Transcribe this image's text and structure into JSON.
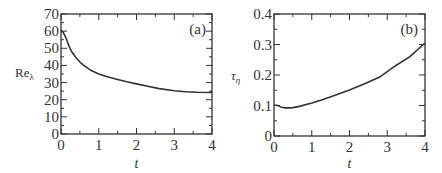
{
  "chart_data": [
    {
      "type": "line",
      "panel_label": "(a)",
      "title": "",
      "xlabel": "t",
      "ylabel": "Re_λ",
      "ylabel_main": "Re",
      "ylabel_sub": "λ",
      "xlim": [
        0,
        4
      ],
      "ylim": [
        0,
        70
      ],
      "xticks": [
        0,
        1,
        2,
        3,
        4
      ],
      "xtick_labels": [
        "0",
        "1",
        "2",
        "3",
        "4"
      ],
      "yticks": [
        0,
        10,
        20,
        30,
        40,
        50,
        60,
        70
      ],
      "ytick_labels": [
        "0",
        "10",
        "20",
        "30",
        "40",
        "50",
        "60",
        "70"
      ],
      "x_minor_step": 0.5,
      "y_minor_step": 5,
      "grid": false,
      "series": [
        {
          "name": "Re_lambda",
          "x": [
            0,
            0.05,
            0.1,
            0.15,
            0.2,
            0.25,
            0.3,
            0.4,
            0.5,
            0.6,
            0.8,
            1.0,
            1.2,
            1.5,
            1.8,
            2.0,
            2.3,
            2.6,
            3.0,
            3.3,
            3.6,
            4.0
          ],
          "y": [
            60.5,
            59.5,
            57.5,
            55,
            52,
            49.5,
            47.5,
            44.5,
            42,
            40,
            37,
            35,
            33.5,
            31.8,
            30.2,
            29.2,
            27.8,
            26.5,
            25.2,
            24.7,
            24.4,
            24.2
          ]
        }
      ]
    },
    {
      "type": "line",
      "panel_label": "(b)",
      "title": "",
      "xlabel": "t",
      "ylabel": "τ_η",
      "ylabel_main": "τ",
      "ylabel_sub": "η",
      "xlim": [
        0,
        4
      ],
      "ylim": [
        0,
        0.4
      ],
      "xticks": [
        0,
        1,
        2,
        3,
        4
      ],
      "xtick_labels": [
        "0",
        "1",
        "2",
        "3",
        "4"
      ],
      "yticks": [
        0,
        0.1,
        0.2,
        0.3,
        0.4
      ],
      "ytick_labels": [
        "0",
        "0.1",
        "0.2",
        "0.3",
        "0.4"
      ],
      "x_minor_step": 0.5,
      "y_minor_step": 0.05,
      "grid": false,
      "series": [
        {
          "name": "tau_eta",
          "x": [
            0,
            0.05,
            0.1,
            0.15,
            0.2,
            0.3,
            0.4,
            0.5,
            0.7,
            1.0,
            1.3,
            1.6,
            2.0,
            2.4,
            2.8,
            3.2,
            3.6,
            4.0
          ],
          "y": [
            0.101,
            0.101,
            0.1,
            0.097,
            0.094,
            0.092,
            0.092,
            0.093,
            0.098,
            0.108,
            0.12,
            0.133,
            0.151,
            0.171,
            0.193,
            0.229,
            0.26,
            0.305
          ]
        }
      ]
    }
  ]
}
